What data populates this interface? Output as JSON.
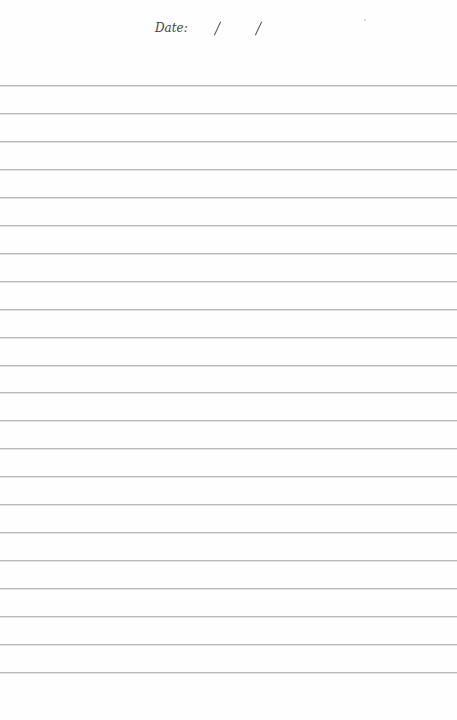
{
  "page": {
    "type": "lined notebook page",
    "background_color": "#ffffff",
    "line_color": "#b9b9b9"
  },
  "header": {
    "date_label": "Date:",
    "date_separator": "/",
    "date_fields": [
      {
        "name": "day",
        "value": ""
      },
      {
        "name": "month",
        "value": ""
      },
      {
        "name": "year",
        "value": ""
      }
    ]
  },
  "ruled_lines": {
    "count": 22,
    "first_line_y": 86,
    "spacing_px": 27.95
  }
}
